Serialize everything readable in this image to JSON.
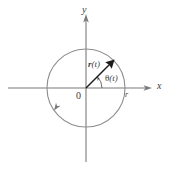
{
  "figure": {
    "name": "uniform-circular-motion-diagram",
    "type": "diagram",
    "width": 170,
    "height": 169,
    "background_color": "#ffffff",
    "stroke_color": "#7a7a7a",
    "text_color": "#3c3c3c",
    "arrow_color": "#1a1a1a"
  },
  "axes": {
    "x_label": "x",
    "y_label": "y",
    "origin_label": "0",
    "origin_px": {
      "x": 86,
      "y": 88
    },
    "x_axis": {
      "x1": 8,
      "y1": 88,
      "x2": 152,
      "y2": 88
    },
    "y_axis": {
      "x1": 86,
      "y1": 14,
      "x2": 86,
      "y2": 162
    }
  },
  "circle": {
    "center_px": {
      "x": 86,
      "y": 88
    },
    "radius_px": 39,
    "radius_label": "r",
    "direction": "counterclockwise",
    "direction_marker_angle_deg": 215
  },
  "vector": {
    "label": "r(t)",
    "label_bold_part": "r",
    "label_arg_part": "(t)",
    "angle_deg": 45,
    "tip_px": {
      "x": 114,
      "y": 60
    },
    "tail_px": {
      "x": 86,
      "y": 88
    }
  },
  "angle": {
    "label": "θ(t)",
    "symbol": "θ",
    "arg": "(t)",
    "arc_radius_px": 16,
    "from_deg": 0,
    "to_deg": 45
  }
}
